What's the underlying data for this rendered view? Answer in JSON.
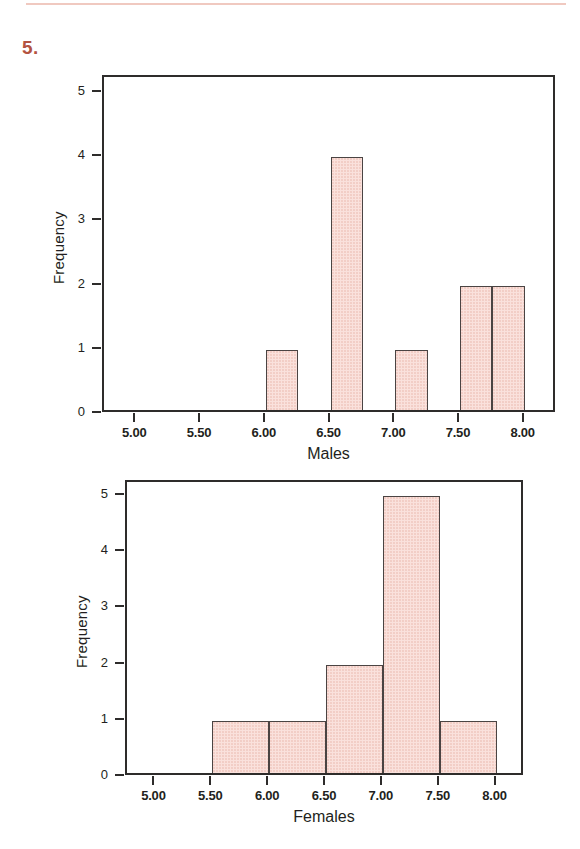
{
  "problem": {
    "number": "5."
  },
  "footer": {
    "ghost_text": ""
  },
  "colors": {
    "accent": "#b35340",
    "bar_fill": "#fae1dc",
    "bar_stroke": "#4a4443",
    "axis": "#2e2c2b",
    "rule": "#f0c9c0"
  },
  "chart_data": [
    {
      "type": "bar",
      "title": "",
      "xlabel": "Males",
      "ylabel": "Frequency",
      "xlim": [
        4.75,
        8.25
      ],
      "ylim": [
        0,
        5.25
      ],
      "grid": false,
      "legend": "none",
      "xticks": [
        "5.00",
        "5.50",
        "6.00",
        "6.50",
        "7.00",
        "7.50",
        "8.00"
      ],
      "xtick_values": [
        5.0,
        5.5,
        6.0,
        6.5,
        7.0,
        7.5,
        8.0
      ],
      "yticks": [
        "0",
        "1",
        "2",
        "3",
        "4",
        "5"
      ],
      "ytick_values": [
        0,
        1,
        2,
        3,
        4,
        5
      ],
      "bin_width": 0.25,
      "bins": [
        {
          "start": 6.0,
          "end": 6.25,
          "value": 1
        },
        {
          "start": 6.5,
          "end": 6.75,
          "value": 4
        },
        {
          "start": 7.0,
          "end": 7.25,
          "value": 1
        },
        {
          "start": 7.5,
          "end": 7.75,
          "value": 2
        },
        {
          "start": 7.75,
          "end": 8.0,
          "value": 2
        }
      ]
    },
    {
      "type": "bar",
      "title": "",
      "xlabel": "Females",
      "ylabel": "Frequency",
      "xlim": [
        4.75,
        8.25
      ],
      "ylim": [
        0,
        5.25
      ],
      "grid": false,
      "legend": "none",
      "xticks": [
        "5.00",
        "5.50",
        "6.00",
        "6.50",
        "7.00",
        "7.50",
        "8.00"
      ],
      "xtick_values": [
        5.0,
        5.5,
        6.0,
        6.5,
        7.0,
        7.5,
        8.0
      ],
      "yticks": [
        "0",
        "1",
        "2",
        "3",
        "4",
        "5"
      ],
      "ytick_values": [
        0,
        1,
        2,
        3,
        4,
        5
      ],
      "bin_width": 0.5,
      "bins": [
        {
          "start": 5.5,
          "end": 6.0,
          "value": 1
        },
        {
          "start": 6.0,
          "end": 6.5,
          "value": 1
        },
        {
          "start": 6.5,
          "end": 7.0,
          "value": 2
        },
        {
          "start": 7.0,
          "end": 7.5,
          "value": 5
        },
        {
          "start": 7.5,
          "end": 8.0,
          "value": 1
        }
      ]
    }
  ],
  "figures": [
    {
      "name": "males-histogram",
      "frame": {
        "left": 102,
        "top": 75,
        "width": 453,
        "height": 337
      }
    },
    {
      "name": "females-histogram",
      "frame": {
        "left": 125,
        "top": 480,
        "width": 398,
        "height": 295
      }
    }
  ]
}
